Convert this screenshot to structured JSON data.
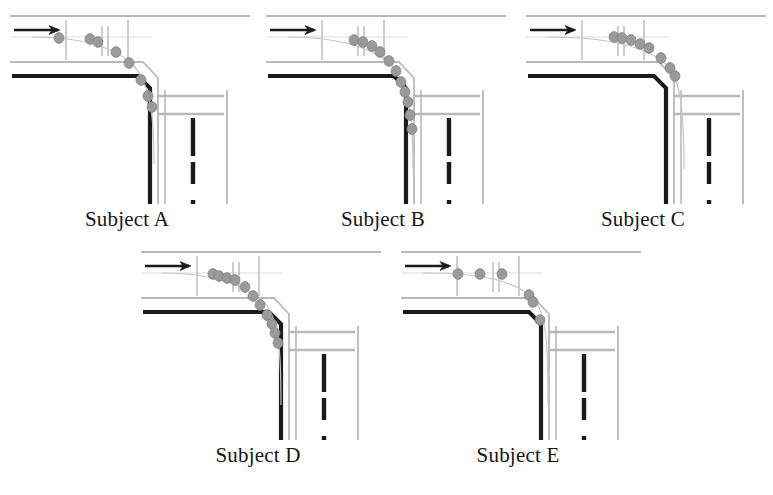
{
  "figure": {
    "background_color": "#ffffff",
    "panel_count": 5
  },
  "style": {
    "curb_color": "#b9b9b9",
    "lane_marking_color": "#c9c9c9",
    "solid_edge_color": "#1a1a1a",
    "dashed_center_color": "#1a1a1a",
    "trajectory_dot_color": "#9a9a9a",
    "trajectory_dot_stroke": "#7f7f7f",
    "trajectory_path_color": "#c6c6c6",
    "arrow_color": "#1a1a1a",
    "label_color": "#151515",
    "stop_bar_color": "#bdbdbd"
  },
  "panels": [
    {
      "id": "a",
      "label": "Subject A",
      "arrow_label": "direction-of-travel-arrow",
      "dot_count": 8,
      "dots": [
        {
          "x": 57,
          "y": 34
        },
        {
          "x": 88,
          "y": 35
        },
        {
          "x": 96,
          "y": 38
        },
        {
          "x": 114,
          "y": 48
        },
        {
          "x": 127,
          "y": 59
        },
        {
          "x": 139,
          "y": 76
        },
        {
          "x": 146,
          "y": 92
        },
        {
          "x": 150,
          "y": 103
        }
      ],
      "path": "M 30 33 C 70 33, 110 40, 132 62 C 148 80, 152 110, 152 160"
    },
    {
      "id": "b",
      "label": "Subject B",
      "arrow_label": "direction-of-travel-arrow",
      "dot_count": 11,
      "dots": [
        {
          "x": 96,
          "y": 36
        },
        {
          "x": 105,
          "y": 38
        },
        {
          "x": 114,
          "y": 42
        },
        {
          "x": 122,
          "y": 48
        },
        {
          "x": 131,
          "y": 57
        },
        {
          "x": 138,
          "y": 67
        },
        {
          "x": 143,
          "y": 78
        },
        {
          "x": 147,
          "y": 88
        },
        {
          "x": 150,
          "y": 98
        },
        {
          "x": 152,
          "y": 111
        },
        {
          "x": 154,
          "y": 125
        }
      ],
      "path": "M 30 33 C 70 33, 112 40, 134 62 C 150 80, 155 110, 155 165"
    },
    {
      "id": "c",
      "label": "Subject C",
      "arrow_label": "direction-of-travel-arrow",
      "dot_count": 8,
      "dots": [
        {
          "x": 96,
          "y": 33
        },
        {
          "x": 104,
          "y": 34
        },
        {
          "x": 113,
          "y": 36
        },
        {
          "x": 122,
          "y": 40
        },
        {
          "x": 131,
          "y": 44
        },
        {
          "x": 143,
          "y": 54
        },
        {
          "x": 152,
          "y": 64
        },
        {
          "x": 157,
          "y": 72
        }
      ],
      "path": "M 30 33 C 75 33, 125 38, 150 62 C 163 77, 166 110, 166 165"
    },
    {
      "id": "d",
      "label": "Subject D",
      "arrow_label": "direction-of-travel-arrow",
      "dot_count": 11,
      "dots": [
        {
          "x": 80,
          "y": 34
        },
        {
          "x": 86,
          "y": 36
        },
        {
          "x": 94,
          "y": 38
        },
        {
          "x": 102,
          "y": 40
        },
        {
          "x": 112,
          "y": 47
        },
        {
          "x": 120,
          "y": 56
        },
        {
          "x": 127,
          "y": 65
        },
        {
          "x": 134,
          "y": 75
        },
        {
          "x": 139,
          "y": 84
        },
        {
          "x": 142,
          "y": 93
        },
        {
          "x": 145,
          "y": 103
        }
      ],
      "path": "M 30 33 C 70 33, 112 42, 133 64 C 146 82, 148 112, 148 165"
    },
    {
      "id": "e",
      "label": "Subject E",
      "arrow_label": "direction-of-travel-arrow",
      "dot_count": 6,
      "dots": [
        {
          "x": 65,
          "y": 34
        },
        {
          "x": 87,
          "y": 34
        },
        {
          "x": 109,
          "y": 34
        },
        {
          "x": 136,
          "y": 55
        },
        {
          "x": 140,
          "y": 62
        },
        {
          "x": 147,
          "y": 80
        }
      ],
      "path": "M 30 33 C 78 33, 125 38, 143 62 C 154 78, 155 110, 155 165"
    }
  ],
  "geometry": {
    "top_road": {
      "north_curb_y": 12,
      "lane_divider_y": 33,
      "south_curb_y": 58,
      "description": "horizontal two-lane road entering from the left"
    },
    "right_road": {
      "west_edge_x": 163,
      "lane_divider_x": 192,
      "east_edge_x": 225,
      "description": "vertical two-lane road exiting toward the bottom"
    },
    "corner": {
      "solid_edge": "thick black curb with chamfered corner",
      "corner_x": 148,
      "corner_y": 74
    },
    "stop_bars": [
      {
        "name": "crosswalk-tick-1",
        "x": 64
      },
      {
        "name": "crosswalk-tick-2",
        "x": 100
      },
      {
        "name": "crosswalk-tick-3",
        "x": 106
      },
      {
        "name": "crosswalk-tick-4",
        "x": 126
      }
    ],
    "crosswalk_bands": [
      {
        "name": "right-road-crosswalk-upper",
        "y": 92
      },
      {
        "name": "right-road-crosswalk-lower",
        "y": 110
      }
    ],
    "dashed_center_line": {
      "x": 192,
      "dash_pattern": "22 16",
      "start_y": 116,
      "end_y": 200
    }
  }
}
